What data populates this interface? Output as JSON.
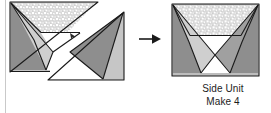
{
  "page": {
    "background": "#ffffff",
    "margin_rule_color": "#c9c9c9"
  },
  "palette": {
    "outline": "#1a1a1a",
    "dark_gray": "#8e8e8e",
    "mid_gray": "#a8a8a8",
    "light_gray": "#c6c6c6",
    "pale_gray": "#d6d6d6",
    "white": "#ffffff",
    "speckle_base": "#d9d9d9",
    "speckle_dot": "#ffffff",
    "arrow": "#1a1a1a"
  },
  "caption": {
    "line1": "Side Unit",
    "line2": "Make 4"
  },
  "arrow": {
    "name": "right-arrow-icon",
    "direction": "right",
    "label": "becomes"
  },
  "left_figure": {
    "name": "split-unit-before",
    "description": "Rectangle cut on a diagonal into two separated pieces",
    "pieces": [
      {
        "name": "upper-left-piece",
        "fill": "#c6c6c6",
        "parts": [
          {
            "name": "speckled-band",
            "fill": "speckle"
          },
          {
            "name": "left-dark-wedge",
            "fill": "#8e8e8e"
          },
          {
            "name": "inner-light-triangle",
            "fill": "#c6c6c6"
          },
          {
            "name": "white-notch",
            "fill": "#ffffff"
          }
        ]
      },
      {
        "name": "lower-right-piece",
        "fill": "#c6c6c6",
        "parts": [
          {
            "name": "dark-triangle",
            "fill": "#8e8e8e"
          },
          {
            "name": "white-triangle",
            "fill": "#ffffff"
          }
        ]
      }
    ]
  },
  "right_figure": {
    "name": "side-unit-after",
    "description": "Assembled rectangle, symmetric, speckled top band and two crossing wedges",
    "parts": [
      {
        "name": "speckled-band",
        "fill": "speckle"
      },
      {
        "name": "left-dark-wedge",
        "fill": "#8e8e8e"
      },
      {
        "name": "left-light-triangle",
        "fill": "#c6c6c6"
      },
      {
        "name": "right-dark-wedge",
        "fill": "#8e8e8e"
      },
      {
        "name": "right-mid-triangle",
        "fill": "#a8a8a8"
      },
      {
        "name": "center-white-notch",
        "fill": "#ffffff"
      },
      {
        "name": "bottom-white-triangle",
        "fill": "#ffffff"
      }
    ]
  }
}
